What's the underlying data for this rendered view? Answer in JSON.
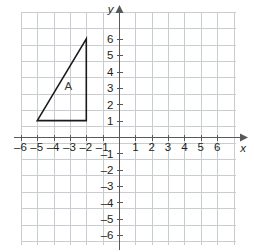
{
  "figure": {
    "title": "",
    "background_color": "#ffffff",
    "grid_color": "#c8cdd2",
    "axis_color": "#58595b",
    "shape_color": "#1a1a1a"
  },
  "chart_data": {
    "type": "scatter",
    "title": "",
    "xlabel": "x",
    "ylabel": "y",
    "xlim": [
      -6.5,
      7.0
    ],
    "ylim": [
      -6.5,
      6.8
    ],
    "grid": true,
    "grid_spacing": 1,
    "legend": "none",
    "x_tick_labels": [
      "–6",
      "–5",
      "–4",
      "–3",
      "–2",
      "–1",
      "1",
      "2",
      "3",
      "4",
      "5",
      "6"
    ],
    "x_tick_values": [
      -6,
      -5,
      -4,
      -3,
      -2,
      -1,
      1,
      2,
      3,
      4,
      5,
      6
    ],
    "y_tick_labels": [
      "6",
      "5",
      "4",
      "3",
      "2",
      "1",
      "–1",
      "–2",
      "–3",
      "–4",
      "–5",
      "–6"
    ],
    "y_tick_values": [
      6,
      5,
      4,
      3,
      2,
      1,
      -1,
      -2,
      -3,
      -4,
      -5,
      -6
    ],
    "shapes": [
      {
        "name": "A",
        "kind": "triangle",
        "vertices": [
          [
            -5,
            1
          ],
          [
            -2,
            1
          ],
          [
            -2,
            6
          ]
        ],
        "label": "A",
        "label_position": [
          -3.1,
          3.1
        ],
        "filled": false
      }
    ],
    "annotations": [
      {
        "text": "A",
        "x": -3.1,
        "y": 3.1
      }
    ]
  },
  "axes": {
    "x_axis_label": "x",
    "y_axis_label": "y",
    "x_labels": [
      {
        "text": "–6",
        "value": -6
      },
      {
        "text": "–5",
        "value": -5
      },
      {
        "text": "–4",
        "value": -4
      },
      {
        "text": "–3",
        "value": -3
      },
      {
        "text": "–2",
        "value": -2
      },
      {
        "text": "–1",
        "value": -1
      },
      {
        "text": "1",
        "value": 1
      },
      {
        "text": "2",
        "value": 2
      },
      {
        "text": "3",
        "value": 3
      },
      {
        "text": "4",
        "value": 4
      },
      {
        "text": "5",
        "value": 5
      },
      {
        "text": "6",
        "value": 6
      }
    ],
    "y_labels": [
      {
        "text": "6",
        "value": 6
      },
      {
        "text": "5",
        "value": 5
      },
      {
        "text": "4",
        "value": 4
      },
      {
        "text": "3",
        "value": 3
      },
      {
        "text": "2",
        "value": 2
      },
      {
        "text": "1",
        "value": 1
      },
      {
        "text": "–1",
        "value": -1
      },
      {
        "text": "–2",
        "value": -2
      },
      {
        "text": "–3",
        "value": -3
      },
      {
        "text": "–4",
        "value": -4
      },
      {
        "text": "–5",
        "value": -5
      },
      {
        "text": "–6",
        "value": -6
      }
    ]
  },
  "shape_label": "A"
}
